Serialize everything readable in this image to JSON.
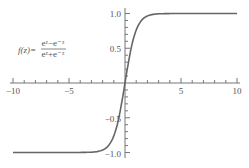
{
  "chart_data": {
    "type": "line",
    "title": "",
    "annotation": {
      "lhs": "f(z)=",
      "numerator": "e^z − e^−z",
      "denominator": "e^z + e^−z"
    },
    "xlabel": "",
    "ylabel": "",
    "xlim": [
      -10,
      10
    ],
    "ylim": [
      -1,
      1
    ],
    "x_ticks": [
      "-10",
      "-5",
      "5",
      "10"
    ],
    "y_ticks": [
      "1.0",
      "0.5",
      "-0.5",
      "-1.0"
    ],
    "grid": false,
    "series": [
      {
        "name": "tanh(z)",
        "function": "tanh",
        "x": [
          -10,
          -5,
          -2,
          -1,
          0,
          1,
          2,
          5,
          10
        ],
        "values": [
          -1,
          -0.9999,
          -0.964,
          -0.762,
          0,
          0.762,
          0.964,
          0.9999,
          1
        ]
      }
    ]
  },
  "labels": {
    "lhs": "f(z)=",
    "num": "eᶻ−e⁻ᶻ",
    "den": "eᶻ+e⁻ᶻ",
    "x_m10": "−10",
    "x_m5": "−5",
    "x_5": "5",
    "x_10": "10",
    "y_1": "1.0",
    "y_05": "0.5",
    "y_m05": "−0.5",
    "y_m1": "−1.0"
  }
}
